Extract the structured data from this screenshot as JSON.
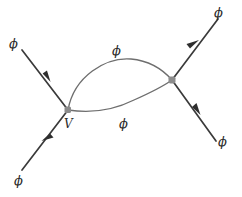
{
  "figure": {
    "kind": "feynman-diagram",
    "background_color": "#ffffff",
    "leg_color": "#3a3a3a",
    "loop_color": "#6e6e6e",
    "vertex_color": "#8c8c8c",
    "label_color": "#2b2b2b"
  },
  "vertices": [
    {
      "id": "left-vertex",
      "label": "V",
      "label_x": 64,
      "label_y": 118,
      "x": 68,
      "y": 110
    },
    {
      "id": "right-vertex",
      "label": "",
      "x": 172,
      "y": 80
    }
  ],
  "external_legs": [
    {
      "id": "leg-upper-left",
      "label": "ϕ",
      "label_x": 9,
      "label_y": 37,
      "direction": "incoming",
      "arrow_direction": "down-right"
    },
    {
      "id": "leg-lower-left",
      "label": "ϕ",
      "label_x": 14,
      "label_y": 174,
      "direction": "incoming",
      "arrow_direction": "up-right"
    },
    {
      "id": "leg-upper-right",
      "label": "ϕ",
      "label_x": 214,
      "label_y": 6,
      "direction": "outgoing",
      "arrow_direction": "up-right"
    },
    {
      "id": "leg-lower-right",
      "label": "ϕ",
      "label_x": 218,
      "label_y": 135,
      "direction": "outgoing",
      "arrow_direction": "down-right"
    }
  ],
  "loop_propagators": [
    {
      "id": "loop-upper",
      "label": "ϕ",
      "label_x": 112,
      "label_y": 44
    },
    {
      "id": "loop-lower",
      "label": "ϕ",
      "label_x": 119,
      "label_y": 117
    }
  ]
}
